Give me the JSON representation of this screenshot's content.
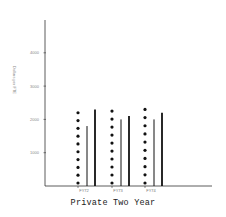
{
  "chart_data": {
    "type": "bar",
    "title": "Private Two Year",
    "xlabel": "",
    "ylabel": "Dollars per FTE",
    "categories": [
      "FY72",
      "FY73",
      "FY74"
    ],
    "series": [
      {
        "name": "Series 1 (dotted)",
        "style": "dotted",
        "values": [
          2200,
          2250,
          2300
        ]
      },
      {
        "name": "Series 2 (thin line)",
        "style": "thin",
        "values": [
          1800,
          2000,
          2000
        ]
      },
      {
        "name": "Series 3 (thick line)",
        "style": "thick",
        "values": [
          2300,
          2100,
          2200
        ]
      }
    ],
    "yticks": [
      1000,
      2000,
      3000,
      4000
    ],
    "ytick_labels": [
      "1000",
      "2000",
      "3000",
      "4000"
    ],
    "ylim": [
      0,
      5000
    ],
    "grid": false,
    "legend": "none"
  },
  "colors": {
    "ink": "#111111",
    "axis": "#333333",
    "background": "#ffffff"
  }
}
